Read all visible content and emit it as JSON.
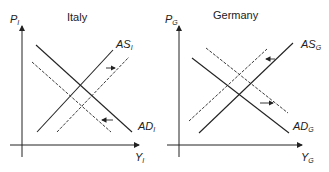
{
  "panels": [
    {
      "title": "Italy",
      "y_axis": {
        "base": "P",
        "sub": "I"
      },
      "x_axis": {
        "base": "Y",
        "sub": "I"
      },
      "curves": {
        "as": {
          "base": "AS",
          "sub": "I"
        },
        "ad": {
          "base": "AD",
          "sub": "I"
        }
      },
      "shifts": {
        "as": "right",
        "ad": "left"
      }
    },
    {
      "title": "Germany",
      "y_axis": {
        "base": "P",
        "sub": "G"
      },
      "x_axis": {
        "base": "Y",
        "sub": "G"
      },
      "curves": {
        "as": {
          "base": "AS",
          "sub": "G"
        },
        "ad": {
          "base": "AD",
          "sub": "G"
        }
      },
      "shifts": {
        "as": "left",
        "ad": "right"
      }
    }
  ],
  "colors": {
    "line": "#222222",
    "background": "#ffffff"
  }
}
